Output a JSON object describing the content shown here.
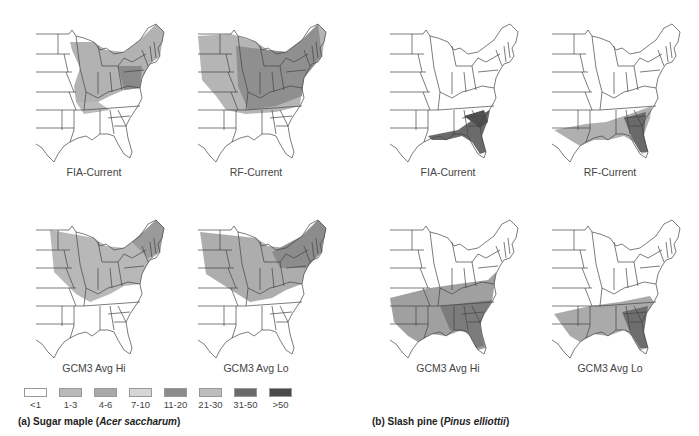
{
  "figure": {
    "panel_a": {
      "caption_prefix": "(a) Sugar maple (",
      "caption_species": "Acer saccharum",
      "caption_suffix": ")",
      "maps": [
        {
          "label": "FIA-Current",
          "shade": "north_east_patchy"
        },
        {
          "label": "RF-Current",
          "shade": "north_east_full"
        },
        {
          "label": "GCM3 Avg Hi",
          "shade": "north_light"
        },
        {
          "label": "GCM3 Avg Lo",
          "shade": "north_medium"
        }
      ]
    },
    "panel_b": {
      "caption_prefix": "(b) Slash pine (",
      "caption_species": "Pinus elliottii",
      "caption_suffix": ")",
      "maps": [
        {
          "label": "FIA-Current",
          "shade": "southeast_coast"
        },
        {
          "label": "RF-Current",
          "shade": "gulf_coast"
        },
        {
          "label": "GCM3 Avg Hi",
          "shade": "south_broad"
        },
        {
          "label": "GCM3 Avg Lo",
          "shade": "south_medium"
        }
      ]
    },
    "legend": {
      "title": "",
      "classes": [
        {
          "label": "<1",
          "color": "#ffffff"
        },
        {
          "label": "1-3",
          "color": "#b9b9b9"
        },
        {
          "label": "4-6",
          "color": "#a9a9a9"
        },
        {
          "label": "7-10",
          "color": "#d6d6d6"
        },
        {
          "label": "11-20",
          "color": "#8c8c8c"
        },
        {
          "label": "21-30",
          "color": "#bdbdbd"
        },
        {
          "label": "31-50",
          "color": "#6a6a6a"
        },
        {
          "label": ">50",
          "color": "#4a4a4a"
        }
      ]
    }
  }
}
